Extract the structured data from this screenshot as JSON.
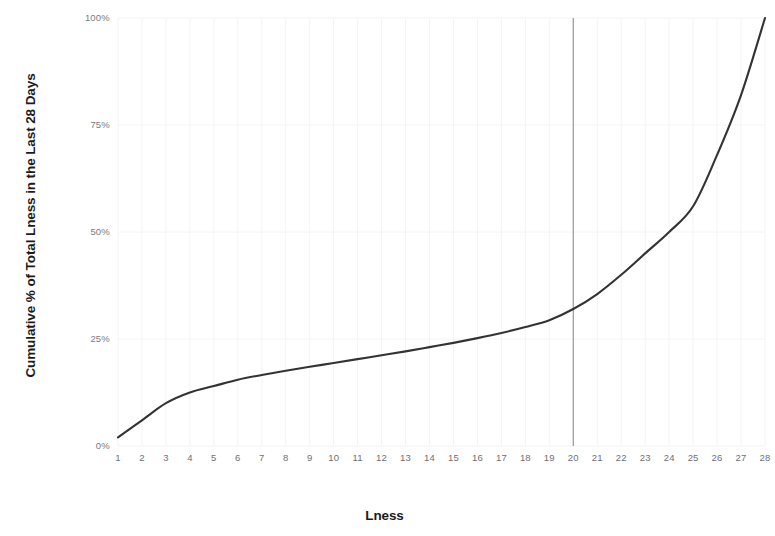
{
  "chart_data": {
    "type": "line",
    "title": "",
    "xlabel": "Lness",
    "ylabel": "Cumulative % of Total Lness in the Last 28 Days",
    "x": [
      1,
      2,
      3,
      4,
      5,
      6,
      7,
      8,
      9,
      10,
      11,
      12,
      13,
      14,
      15,
      16,
      17,
      18,
      19,
      20,
      21,
      22,
      23,
      24,
      25,
      26,
      27,
      28
    ],
    "values": [
      2,
      6,
      10,
      12.5,
      14,
      15.5,
      16.6,
      17.6,
      18.5,
      19.4,
      20.3,
      21.2,
      22.1,
      23.1,
      24.1,
      25.2,
      26.4,
      27.8,
      29.4,
      32,
      35.5,
      40,
      45,
      50,
      56,
      68,
      82,
      100
    ],
    "x_tick_labels": [
      "1",
      "2",
      "3",
      "4",
      "5",
      "6",
      "7",
      "8",
      "9",
      "10",
      "11",
      "12",
      "13",
      "14",
      "15",
      "16",
      "17",
      "18",
      "19",
      "20",
      "21",
      "22",
      "23",
      "24",
      "25",
      "26",
      "27",
      "28"
    ],
    "y_tick_labels": [
      "0%",
      "25%",
      "50%",
      "75%",
      "100%"
    ],
    "y_tick_values": [
      0,
      25,
      50,
      75,
      100
    ],
    "xlim": [
      1,
      28
    ],
    "ylim": [
      0,
      100
    ],
    "grid": true,
    "legend": "none",
    "line_color": "#333333",
    "grid_color": "#f4f4f4",
    "tick_label_color": "#777777",
    "axis_title_color": "#1b1b1b",
    "annotations": [
      {
        "name": "vertical-reference-line",
        "type": "vline",
        "x": 20,
        "color": "#9a9a9a",
        "label": ""
      }
    ]
  }
}
